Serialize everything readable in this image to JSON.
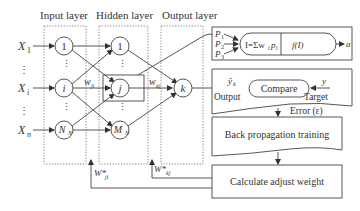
{
  "layers": {
    "input": "Input layer",
    "hidden": "Hidden layer",
    "output": "Output layer"
  },
  "inputs": {
    "x1": "X",
    "x1_sub": "1",
    "xi": "X",
    "xi_sub": "i",
    "xn": "X",
    "xn_sub": "n"
  },
  "input_nodes": {
    "n1": "1",
    "ni": "i",
    "nN": "N",
    "nN_sub": "N"
  },
  "hidden_nodes": {
    "n1": "1",
    "nj": "j",
    "nM": "M",
    "nM_sub": "N"
  },
  "output_node": "k",
  "ellipsis": "⋮",
  "weights": {
    "wji": "w",
    "wji_sub": "ji",
    "wkj": "w",
    "wkj_sub": "kj",
    "Wji_star": "W*",
    "Wji_star_sub": "ji",
    "Wkj_star": "W*",
    "Wkj_star_sub": "kj"
  },
  "neuron_box": {
    "p1": "P",
    "p1_sub": "1",
    "p2": "P",
    "p2_sub": "2",
    "p3": "P",
    "p3_sub": "3",
    "sum": "I=Σw",
    "sum_sub1": "i",
    "sum_p": "p",
    "sum_sub2": "i",
    "activation": "f(I)",
    "output": "a"
  },
  "compare_box": {
    "yhat": "ŷ",
    "yhat_sub": "k",
    "output_label": "Output",
    "compare": "Compare",
    "y": "y",
    "target_label": "Target"
  },
  "error_label": "Error (ε)",
  "backprop_label": "Back propagation training",
  "adjust_label": "Calculate adjust weight"
}
